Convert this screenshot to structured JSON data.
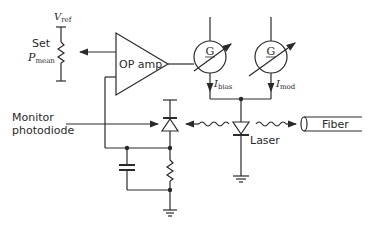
{
  "diagram": {
    "type": "circuit",
    "labels": {
      "vref": {
        "main": "V",
        "sub": "ref"
      },
      "set": "Set",
      "pmean": {
        "main": "P",
        "sub": "mean"
      },
      "opamp": "OP amp",
      "gain_symbol": "G",
      "ibias": {
        "main": "I",
        "sub": "bias"
      },
      "imod": {
        "main": "I",
        "sub": "mod"
      },
      "monitor_line1": "Monitor",
      "monitor_line2": "photodiode",
      "laser": "Laser",
      "fiber": "Fiber"
    },
    "stroke_color": "#2a2a2a"
  }
}
